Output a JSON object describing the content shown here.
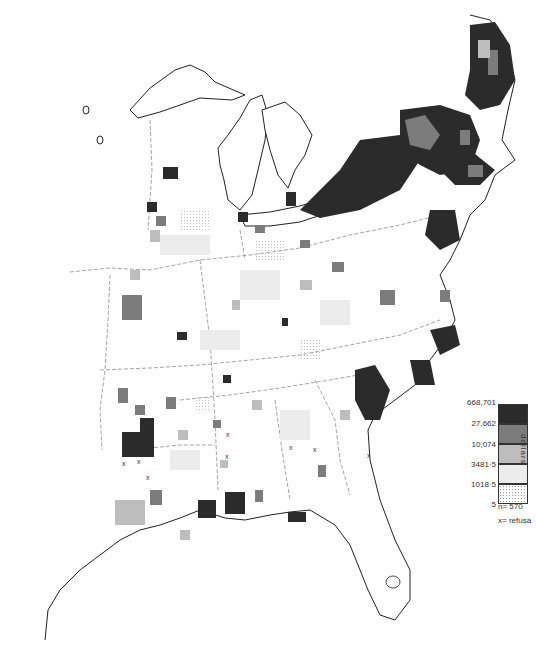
{
  "map": {
    "region": "Eastern United States",
    "classes": [
      {
        "upper": "668,701",
        "color": "#2b2b2b"
      },
      {
        "upper": "27,662",
        "color": "#7c7c7c"
      },
      {
        "upper": "10,074",
        "color": "#bdbdbd"
      },
      {
        "upper": "3481·5",
        "color": "#ececec"
      },
      {
        "upper": "1018·5",
        "color": "stipple"
      }
    ],
    "refusal_marker": "x"
  },
  "legend": {
    "values": [
      "668,701",
      "27,662",
      "10,074",
      "3481·5",
      "1018·5",
      "5"
    ],
    "unit": "dollars",
    "n_label": "n= 570",
    "refusal_label": "x= refusa"
  }
}
